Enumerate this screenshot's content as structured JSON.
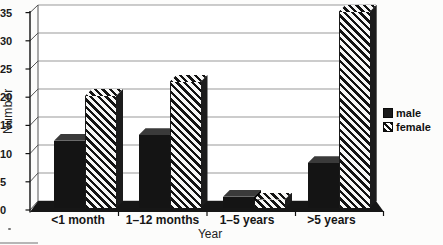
{
  "chart_data": {
    "type": "bar",
    "title": "",
    "categories": [
      "<1 month",
      "1–12 months",
      "1–5 years",
      ">5 years"
    ],
    "series": [
      {
        "name": "male",
        "values": [
          12,
          13,
          2,
          8
        ]
      },
      {
        "name": "female",
        "values": [
          20,
          22.5,
          1.5,
          35
        ]
      }
    ],
    "xlabel": "Year",
    "ylabel": "Number",
    "ylim": [
      0,
      35
    ],
    "y_ticks": [
      0,
      5,
      10,
      15,
      20,
      25,
      30,
      35
    ],
    "grid": true,
    "legend_position": "right",
    "style": "3d-column",
    "colors": {
      "male": "#141414",
      "female_stripe": "#131313",
      "female_background": "#ffffff",
      "gridline": "#999999",
      "floor": "#161616"
    }
  }
}
